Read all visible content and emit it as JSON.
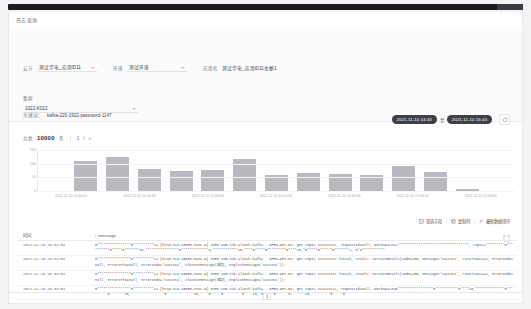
{
  "window": {
    "title": "日志查询"
  },
  "filters": {
    "fields": [
      {
        "label": "云方",
        "value": "测试华电_应用ID11",
        "type": "select"
      },
      {
        "label": "环境",
        "value": "测试环境",
        "type": "select"
      },
      {
        "label": "应用名",
        "value": "测试华电_应用ID11金额1",
        "type": "text"
      },
      {
        "label": "集群",
        "value": "1022-K022",
        "type": "select"
      }
    ],
    "query": {
      "label": "关键词：",
      "value": "kafka-220-1922-password-1147"
    },
    "advanced": {
      "label": "筛选条件",
      "add_icon": "+"
    }
  },
  "daterange": {
    "start": "2021-11-10 14:43",
    "separator": "至",
    "end": "2021-11-10 16:43",
    "refresh_icon": "refresh-icon"
  },
  "chart_data": {
    "type": "bar",
    "title": "",
    "xlabel": "",
    "ylabel": "",
    "toolbar": {
      "total_label": "总数",
      "total_value": "10000",
      "unit": "条",
      "page": "1",
      "page_sep": "/",
      "next_arrow": "»"
    },
    "ylim": [
      0,
      150
    ],
    "yticks": [
      150,
      100,
      50,
      0
    ],
    "grid": true,
    "categories": [
      "2021-11-10 14:44:00",
      "2021-11-10 14:52:00",
      "2021-11-10 15:00:00",
      "2021-11-10 15:08:00",
      "2021-11-10 15:16:00",
      "2021-11-10 15:24:00",
      "2021-11-10 15:32:00",
      "2021-11-10 15:40:00",
      "2021-11-10 15:48:00",
      "2021-11-10 15:56:00",
      "2021-11-10 16:04:00",
      "2021-11-10 16:12:00",
      "2021-11-10 16:20:00",
      "2021-11-10 16:28:00",
      "2021-11-10 16:36:00"
    ],
    "values": [
      0,
      108,
      126,
      82,
      72,
      76,
      116,
      60,
      66,
      62,
      60,
      92,
      68,
      8,
      0
    ],
    "xtick_labels": [
      "2021-11-10 15:44:00",
      "2021-11-10 15:04:00",
      "2021-11-10 15:04:00",
      "2021-11-10 15:04:00",
      "2021-11-10 15:04:00",
      "2021-11-10 15:04:00",
      "2021-11-10 15:04:00"
    ],
    "bar_color": "#b9b9c0"
  },
  "table_actions": [
    {
      "icon": "column-icon",
      "label": "筛选字段"
    },
    {
      "icon": "copy-icon",
      "label": "复制列"
    },
    {
      "icon": "sort-icon",
      "label": "最新数据排序"
    }
  ],
  "expand_icon": "fullscreen-icon",
  "table": {
    "columns": [
      {
        "key": "time",
        "label": "时间"
      },
      {
        "key": "message",
        "label": "message",
        "bullet": "t"
      }
    ],
    "rows": [
      {
        "time": "2021-11-10 16:34:54",
        "message": "0****************0**********11 [http-nio-10000-exec-9] INFO com.tcb.alioth.kafka - OPEN-API-01: get topic statistic, requestId=null, workspace=1**********************************, topic=*********0**********0*****0*******10,****************0*************0,************10,****0*****0*********0****10,*0*****0******0*******1, 0*0***********"
      },
      {
        "time": "2021-11-10 16:34:54",
        "message": "0****************0**********11 [http-nio-10000-exec-9] INFO com.tcb.alioth.kafka - OPEN-API-01: get topic statistic finish, result: ServiceResult(code=200, message='success', resultData=1, errorCode=null, errorInfo=null, errorCode='success', chineseMessage(成功), englishMessage='success'))"
      },
      {
        "time": "2021-11-10 16:34:54",
        "message": "0****************0**********14 [http-nio-10000-exec-9] INFO com.tcb.alioth.kafka - OPEN-API-01: get topic statistic finish, result: ServiceResult(code=200, message='success', resultData=1, errorCode=null, errorInfo=null, errorCode='success', chineseMessage(成功), englishMessage='success'))"
      },
      {
        "time": "2021-11-10 16:34:54",
        "message": "0****************0**********14 [http-nio-10000-exec-9] INFO com.tcb.alioth.kafka - OPEN-API-01: get topic statistic, requestId=null, workspace=0*****************0***********0****10,**************0*********0*******10,****************0*************10,****0*****0*********0****10,*0*****0******0*******10,*********0*****0****"
      }
    ]
  },
  "pager": {
    "current": "1"
  }
}
